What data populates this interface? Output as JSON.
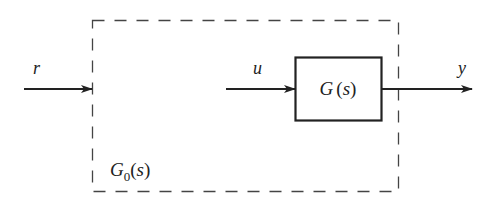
{
  "diagram": {
    "type": "block-diagram",
    "colors": {
      "stroke": "#222222",
      "dashed": "#444444",
      "background": "#ffffff"
    },
    "signals": {
      "input_r": "r",
      "input_u": "u",
      "output_y": "y"
    },
    "blocks": {
      "plant": {
        "name": "G",
        "paren_open": "(",
        "var": "s",
        "paren_close": ")"
      },
      "outer": {
        "name": "G",
        "subscript": "0",
        "paren_open": "(",
        "var": "s",
        "paren_close": ")"
      }
    }
  }
}
